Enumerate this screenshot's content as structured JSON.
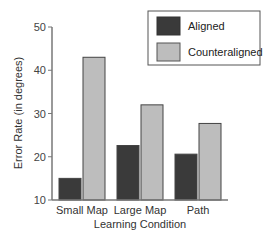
{
  "chart_data": {
    "type": "bar",
    "title": "",
    "xlabel": "Learning Condition",
    "ylabel": "Error Rate (in degrees)",
    "ylim": [
      10,
      50
    ],
    "yticks": [
      10,
      20,
      30,
      40,
      50
    ],
    "categories": [
      "Small Map",
      "Large Map",
      "Path"
    ],
    "series": [
      {
        "name": "Aligned",
        "color": "#3a3a3a",
        "values": [
          15,
          22.6,
          20.6
        ]
      },
      {
        "name": "Counteraligned",
        "color": "#bdbdbd",
        "values": [
          43,
          32,
          27.7
        ]
      }
    ],
    "legend_position": "top-right",
    "grid": false
  },
  "colors": {
    "aligned": "#3a3a3a",
    "counteraligned": "#bdbdbd",
    "axis": "#777777",
    "bar_edge": "#555555"
  }
}
